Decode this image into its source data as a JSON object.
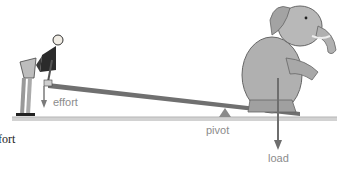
{
  "diagram": {
    "type": "first-class lever illustration",
    "labels": {
      "effort": "effort",
      "pivot": "pivot",
      "load": "load",
      "cut_caption": "fort"
    },
    "colors": {
      "lever": "#6e6e6e",
      "arrow": "#7a7a7a",
      "ground": "#c8c8c8",
      "label": "#8c8c8c",
      "elephant": "#a9a9a9"
    }
  }
}
